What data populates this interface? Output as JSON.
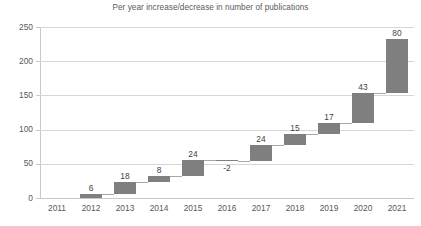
{
  "chart_data": {
    "type": "bar",
    "subtype": "waterfall",
    "title": "Per year increase/decrease in number of publications",
    "xlabel": "",
    "ylabel": "",
    "ylim": [
      0,
      250
    ],
    "ytick_step": 50,
    "ytick_labels": [
      "0",
      "50",
      "100",
      "150",
      "200",
      "250"
    ],
    "ytick_values": [
      0,
      50,
      100,
      150,
      200,
      250
    ],
    "categories": [
      "2011",
      "2012",
      "2013",
      "2014",
      "2015",
      "2016",
      "2017",
      "2018",
      "2019",
      "2020",
      "2021"
    ],
    "values": [
      null,
      6,
      18,
      8,
      24,
      -2,
      24,
      15,
      17,
      43,
      80
    ],
    "data_labels": [
      "",
      "6",
      "18",
      "8",
      "24",
      "-2",
      "24",
      "15",
      "17",
      "43",
      "80"
    ],
    "cumulative_start": [
      0,
      0,
      6,
      24,
      32,
      56,
      54,
      78,
      93,
      110,
      153
    ],
    "cumulative_end": [
      0,
      6,
      24,
      32,
      56,
      54,
      78,
      93,
      110,
      153,
      233
    ],
    "grid": true,
    "grid_axis": "y",
    "legend": false,
    "legend_position": "none",
    "bar_color": "#7f7f7f",
    "grid_color": "#d6d6d6",
    "axis_color": "#c9c9c9",
    "label_color": "#595959",
    "title_color": "#5a5a5a",
    "connector_color": "#a8a8a8"
  }
}
